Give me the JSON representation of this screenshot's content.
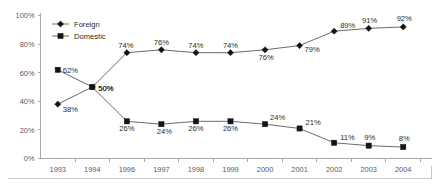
{
  "chart_data": {
    "type": "line",
    "title": "",
    "xlabel": "",
    "ylabel": "",
    "ylim": [
      0,
      100
    ],
    "yticks": [
      "0%",
      "20%",
      "40%",
      "60%",
      "80%",
      "100%"
    ],
    "ytick_values": [
      0,
      20,
      40,
      60,
      80,
      100
    ],
    "grid": false,
    "legend_position": "top-left-inside",
    "categories": [
      "1993",
      "1994",
      "1996",
      "1997",
      "1998",
      "1999",
      "2000",
      "2001",
      "2002",
      "2003",
      "2004"
    ],
    "series": [
      {
        "name": "Foreign",
        "marker": "diamond",
        "color": "#141414",
        "values": [
          38,
          50,
          74,
          76,
          74,
          74,
          76,
          79,
          89,
          91,
          92
        ],
        "labels": [
          "38%",
          "50%",
          "74%",
          "76%",
          "74%",
          "74%",
          "76%",
          "79%",
          "89%",
          "91%",
          "92%"
        ]
      },
      {
        "name": "Domestic",
        "marker": "square",
        "color": "#141414",
        "values": [
          62,
          50,
          26,
          24,
          26,
          26,
          24,
          21,
          11,
          9,
          8
        ],
        "labels": [
          "62%",
          "50%",
          "26%",
          "24%",
          "26%",
          "26%",
          "24%",
          "21%",
          "11%",
          "9%",
          "8%"
        ]
      }
    ]
  },
  "legend": {
    "items": [
      {
        "label": "Foreign",
        "marker": "diamond"
      },
      {
        "label": "Domestic",
        "marker": "square"
      }
    ]
  },
  "axes": {
    "y_tick_labels": [
      "100%",
      "80%",
      "60%",
      "40%",
      "20%",
      "0%"
    ],
    "x_tick_labels": [
      "1993",
      "1994",
      "1996",
      "1997",
      "1998",
      "1999",
      "2000",
      "2001",
      "2002",
      "2003",
      "2004"
    ]
  },
  "colors": {
    "line": "#6b6b6b",
    "marker": "#141414",
    "axis": "#a8a8a8",
    "tick_text": "#5a5a5a",
    "label_text": "#2a2a2a",
    "background": "#ffffff"
  }
}
